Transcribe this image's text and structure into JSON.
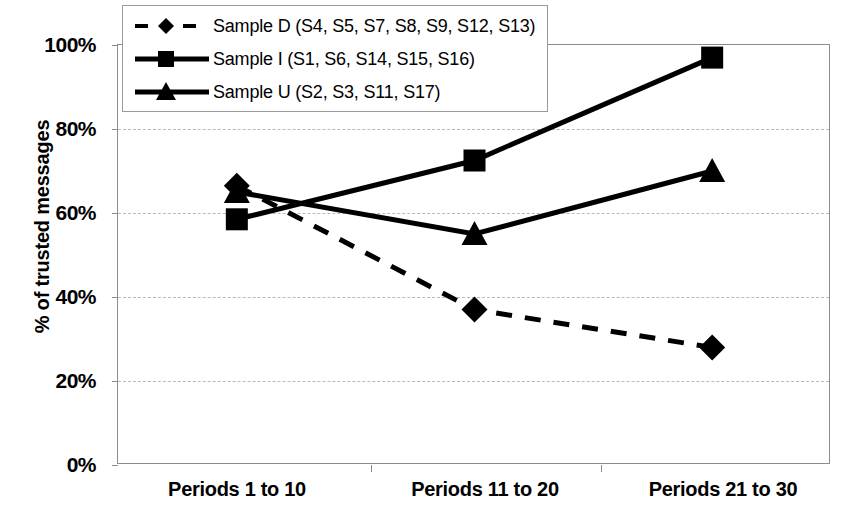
{
  "chart_data": {
    "type": "line",
    "title": "",
    "xlabel": "",
    "ylabel": "% of trusted messages",
    "categories": [
      "Periods 1 to 10",
      "Periods 11 to 20",
      "Periods 21 to 30"
    ],
    "ylim": [
      0,
      100
    ],
    "y_ticks": [
      "0%",
      "20%",
      "40%",
      "60%",
      "80%",
      "100%"
    ],
    "y_tick_values": [
      0,
      20,
      40,
      60,
      80,
      100
    ],
    "grid": true,
    "legend_position": "top-left",
    "series": [
      {
        "name": "Sample D (S4, S5, S7, S8, S9, S12, S13)",
        "marker": "diamond",
        "line_style": "dashed",
        "color": "#000000",
        "values": [
          66.5,
          37,
          28
        ]
      },
      {
        "name": "Sample I (S1, S6, S14, S15, S16)",
        "marker": "square",
        "line_style": "solid",
        "color": "#000000",
        "values": [
          58.5,
          72.5,
          97
        ]
      },
      {
        "name": "Sample U (S2, S3, S11, S17)",
        "marker": "triangle",
        "line_style": "solid",
        "color": "#000000",
        "values": [
          65,
          55,
          70
        ]
      }
    ]
  },
  "axis": {
    "y_title": "% of trusted messages",
    "y_labels": [
      "100%",
      "80%",
      "60%",
      "40%",
      "20%",
      "0%"
    ],
    "x_labels": [
      "Periods 1 to 10",
      "Periods 11 to 20",
      "Periods 21 to 30"
    ]
  },
  "legend": {
    "items": [
      {
        "label": "Sample D (S4, S5, S7, S8, S9, S12, S13)",
        "marker": "diamond",
        "style": "dashed"
      },
      {
        "label": "Sample I (S1, S6, S14, S15, S16)",
        "marker": "square",
        "style": "solid"
      },
      {
        "label": "Sample U (S2, S3, S11, S17)",
        "marker": "triangle",
        "style": "solid"
      }
    ]
  }
}
